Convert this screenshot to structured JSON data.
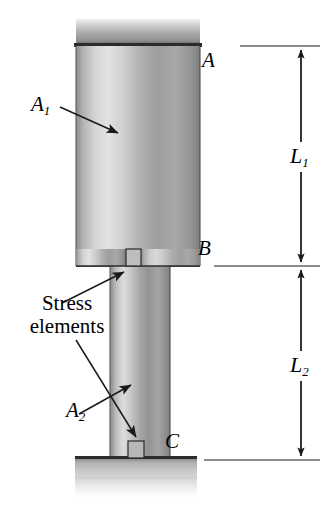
{
  "figure": {
    "background_color": "#ffffff",
    "line_color": "#1a1a1a",
    "metal_light": "#e8e8e8",
    "metal_mid": "#a8a8a8",
    "metal_dark": "#6e6e6e"
  },
  "labels": {
    "point_a": "A",
    "point_b": "B",
    "point_c": "C",
    "area_1": "A",
    "area_1_sub": "1",
    "area_2": "A",
    "area_2_sub": "2",
    "length_1": "L",
    "length_1_sub": "1",
    "length_2": "L",
    "length_2_sub": "2",
    "stress_elements_line1": "Stress",
    "stress_elements_line2": "elements"
  },
  "geometry": {
    "top_plate": {
      "x": 76,
      "y": 19,
      "width": 124,
      "height": 27
    },
    "upper_bar": {
      "x": 76,
      "y": 46,
      "width": 124,
      "height": 220
    },
    "lower_bar": {
      "x": 110,
      "y": 266,
      "width": 60,
      "height": 192
    },
    "base_plate": {
      "x": 75,
      "y": 458,
      "width": 122,
      "height": 21
    },
    "stress_element_b": {
      "x": 126,
      "y": 249,
      "width": 15,
      "height": 17
    },
    "stress_element_c": {
      "x": 128,
      "y": 441,
      "width": 16,
      "height": 17
    }
  },
  "dimensions": {
    "axis_x": 301,
    "extension_top_y": 46,
    "extension_mid_y": 266,
    "extension_bottom_y": 460,
    "l1_label_y": 155,
    "l2_label_y": 364
  }
}
